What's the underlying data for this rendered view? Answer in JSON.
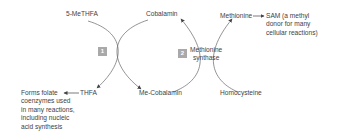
{
  "diagram": {
    "type": "biochemical-pathway",
    "colors": {
      "line": "#555555",
      "badge": "#a9a9a9",
      "text": "#3f3f3f",
      "background": "#ffffff"
    },
    "nodes": {
      "five_methf": "5-MeTHFA",
      "cobalamin": "Cobalamin",
      "methionine": "Methionine",
      "sam_arrow": "→",
      "sam": "SAM (a methyl\ndonor for many\ncellular reactions)",
      "thfa": "THFA",
      "folate_arrow": "←",
      "folate_note": "Forms folate\ncoenzymes used\nin many reactions,\nincluding nucleic\nacid synthesis",
      "me_cobalamin": "Me-Cobalamin",
      "homocysteine": "Homocysteine"
    },
    "reactions": [
      {
        "badge": "1",
        "enzyme": ""
      },
      {
        "badge": "2",
        "enzyme": "Methionine\nsynthase"
      }
    ],
    "edges": [
      {
        "from": "5-MeTHFA",
        "to": "THFA",
        "reaction": "1"
      },
      {
        "from": "Cobalamin",
        "to": "Me-Cobalamin",
        "reaction": "1"
      },
      {
        "from": "Me-Cobalamin",
        "to": "Cobalamin",
        "reaction": "2"
      },
      {
        "from": "Homocysteine",
        "to": "Methionine",
        "reaction": "2"
      },
      {
        "from": "Methionine",
        "to": "SAM"
      },
      {
        "from": "THFA",
        "to": "Forms folate coenzymes"
      }
    ]
  }
}
